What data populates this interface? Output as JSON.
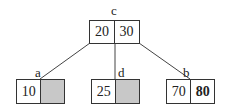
{
  "diagram": {
    "type": "b-tree",
    "nodes": {
      "c": {
        "label": "c",
        "keys": [
          "20",
          "30"
        ],
        "empty": [
          false,
          false
        ],
        "bold": [
          false,
          false
        ]
      },
      "a": {
        "label": "a",
        "keys": [
          "10",
          ""
        ],
        "empty": [
          false,
          true
        ],
        "bold": [
          false,
          false
        ]
      },
      "d": {
        "label": "d",
        "keys": [
          "25",
          ""
        ],
        "empty": [
          false,
          true
        ],
        "bold": [
          false,
          false
        ]
      },
      "b": {
        "label": "b",
        "keys": [
          "70",
          "80"
        ],
        "empty": [
          false,
          false
        ],
        "bold": [
          false,
          true
        ]
      }
    },
    "edges": [
      {
        "from": "c",
        "to": "a"
      },
      {
        "from": "c",
        "to": "d"
      },
      {
        "from": "c",
        "to": "b"
      }
    ],
    "colors": {
      "line": "#333333",
      "empty_cell": "#c8c8c8"
    }
  }
}
